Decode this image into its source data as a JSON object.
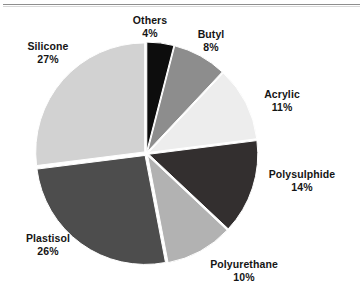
{
  "figure": {
    "background_color": "#ffffff",
    "rule_color": "#8e8e8e"
  },
  "chart_data": {
    "type": "pie",
    "title": "",
    "subtitle": "",
    "xlabel": "",
    "ylabel": "",
    "legend_position": "none",
    "grid": false,
    "units": "percent",
    "start_angle_deg": -90,
    "direction": "clockwise",
    "exploded": true,
    "categories": [
      "Others",
      "Butyl",
      "Acrylic",
      "Polysulphide",
      "Polyurethane",
      "Plastisol",
      "Silicone"
    ],
    "values": [
      4,
      8,
      11,
      14,
      10,
      26,
      27
    ],
    "labels": [
      {
        "name": "Others",
        "value": 4,
        "value_text": "4%",
        "color": "#0d0d0d"
      },
      {
        "name": "Butyl",
        "value": 8,
        "value_text": "8%",
        "color": "#8d8d8d"
      },
      {
        "name": "Acrylic",
        "value": 11,
        "value_text": "11%",
        "color": "#ededed"
      },
      {
        "name": "Polysulphide",
        "value": 14,
        "value_text": "14%",
        "color": "#332f2f"
      },
      {
        "name": "Polyurethane",
        "value": 10,
        "value_text": "10%",
        "color": "#b2b2b2"
      },
      {
        "name": "Plastisol",
        "value": 26,
        "value_text": "26%",
        "color": "#4d4d4d"
      },
      {
        "name": "Silicone",
        "value": 27,
        "value_text": "27%",
        "color": "#d2d2d2"
      }
    ]
  }
}
